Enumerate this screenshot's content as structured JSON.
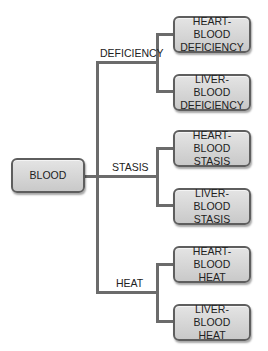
{
  "root": {
    "label": "BLOOD"
  },
  "branches": [
    {
      "label": "DEFICIENCY",
      "children": [
        "HEART-BLOOD\nDEFICIENCY",
        "LIVER-BLOOD\nDEFICIENCY"
      ]
    },
    {
      "label": "STASIS",
      "children": [
        "HEART-BLOOD\nSTASIS",
        "LIVER-BLOOD\nSTASIS"
      ]
    },
    {
      "label": "HEAT",
      "children": [
        "HEART-BLOOD\nHEAT",
        "LIVER-BLOOD\nHEAT"
      ]
    }
  ],
  "colors": {
    "line": "#6b6b6b",
    "box_top": "#e4e4e4",
    "box_bottom": "#c9c9c9",
    "border": "#5e5e5e"
  }
}
